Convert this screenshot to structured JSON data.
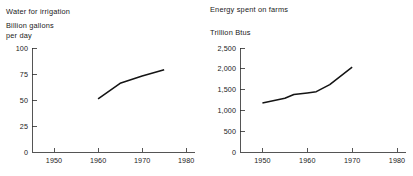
{
  "chart_data": [
    {
      "id": "water-for-irrigation",
      "type": "line",
      "title": "Water for irrigation",
      "ylabel": "Billion gallons",
      "ylabel_line2": "per day",
      "xlabel": "",
      "grid": false,
      "legend": "none",
      "xlim": [
        1945,
        1982
      ],
      "ylim": [
        0,
        100
      ],
      "xticks": [
        1950,
        1960,
        1970,
        1980
      ],
      "xticklabels": [
        "1950",
        "1960",
        "1970",
        "1980"
      ],
      "yticks": [
        0,
        25,
        50,
        75,
        100
      ],
      "yticklabels": [
        "0",
        "25",
        "50",
        "75",
        "100"
      ],
      "x": [
        1960,
        1965,
        1970,
        1975
      ],
      "values": [
        51,
        66,
        73,
        79
      ],
      "series_color": "#141414"
    },
    {
      "id": "energy-spent-on-farms",
      "type": "line",
      "title": "Energy spent on farms",
      "ylabel": "Trillion Btus",
      "ylabel_line2": "",
      "xlabel": "",
      "grid": false,
      "legend": "none",
      "xlim": [
        1945,
        1982
      ],
      "ylim": [
        0,
        2500
      ],
      "xticks": [
        1950,
        1960,
        1970,
        1980
      ],
      "xticklabels": [
        "1950",
        "1960",
        "1970",
        "1980"
      ],
      "yticks": [
        0,
        500,
        1000,
        1500,
        2000,
        2500
      ],
      "yticklabels": [
        "0",
        "500",
        "1,000",
        "1,500",
        "2,000",
        "2,500"
      ],
      "x": [
        1950,
        1955,
        1957,
        1960,
        1962,
        1965,
        1970
      ],
      "values": [
        1180,
        1290,
        1380,
        1420,
        1450,
        1620,
        2040
      ],
      "series_color": "#141414"
    }
  ],
  "left": {
    "title": "Water for irrigation",
    "unit_line1": "Billion gallons",
    "unit_line2": "per day"
  },
  "right": {
    "title": "Energy spent on farms",
    "unit_line1": "Trillion Btus",
    "unit_line2": ""
  }
}
